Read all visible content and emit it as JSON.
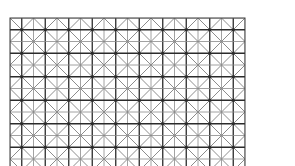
{
  "figure": {
    "bounds": {
      "left": 10,
      "top": 18,
      "right": 245,
      "bottom": 166
    },
    "cell_size": 11.75,
    "columns": 20,
    "rows_visible": 13,
    "colors": {
      "background": "#ffffff",
      "major_line": "#2b2b2b",
      "minor_line": "#8a8a8a",
      "diagonal": "#6e6e6e",
      "border": "#3a3a3a"
    }
  }
}
